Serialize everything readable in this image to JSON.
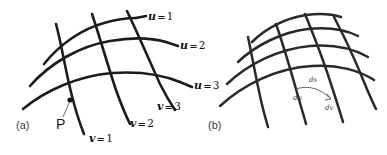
{
  "figure": {
    "background_color": "#ffffff",
    "ink_color": "#1c1c1c",
    "panels": [
      {
        "id": "a",
        "caption": "(a)",
        "point_label": "P"
      },
      {
        "id": "b",
        "caption": "(b)"
      }
    ]
  },
  "panel_a": {
    "caption": "(a)",
    "point_label": "P",
    "u_labels": [
      {
        "var": "u",
        "eq": "=",
        "value": "1"
      },
      {
        "var": "u",
        "eq": "=",
        "value": "2"
      },
      {
        "var": "u",
        "eq": "=",
        "value": "3"
      }
    ],
    "v_labels": [
      {
        "var": "v",
        "eq": "=",
        "value": "1"
      },
      {
        "var": "v",
        "eq": "=",
        "value": "2"
      },
      {
        "var": "v",
        "eq": "=",
        "value": "3"
      }
    ]
  },
  "panel_b": {
    "caption": "(b)",
    "differentials": [
      {
        "name": "ds",
        "text": "ds"
      },
      {
        "name": "du",
        "text": "du"
      },
      {
        "name": "dv",
        "text": "dv"
      }
    ]
  }
}
